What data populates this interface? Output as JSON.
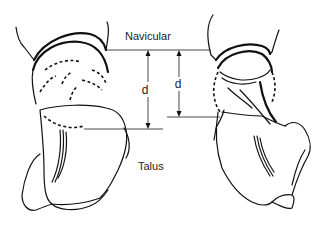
{
  "figure": {
    "labels": {
      "navicular": "Navicular",
      "talus": "Talus",
      "d_left": "d",
      "d_right": "d"
    },
    "views": [
      {
        "name": "left-view",
        "description": "Talus and navicular, view 1"
      },
      {
        "name": "right-view",
        "description": "Talus and navicular, view 2"
      }
    ],
    "dimensions": [
      {
        "name": "d-left",
        "label": "d",
        "from": "navicular-line",
        "to": "left-talus-line"
      },
      {
        "name": "d-right",
        "label": "d",
        "from": "navicular-line",
        "to": "right-talus-line"
      }
    ]
  }
}
